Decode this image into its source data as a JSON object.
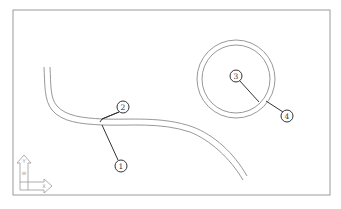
{
  "diagram": {
    "type": "cad-viewport",
    "frame": {
      "x": 13,
      "y": 10,
      "width": 317,
      "height": 185,
      "stroke": "#9a9a9a"
    },
    "colors": {
      "geometry": "#8c8c8c",
      "leader": "#333333",
      "callout_stroke": "#333333",
      "background": "#ffffff"
    },
    "callouts": [
      {
        "id": "1",
        "label": "1",
        "cx": 121,
        "cy": 166,
        "target": "curve-lower-edge"
      },
      {
        "id": "2",
        "label": "2",
        "cx": 123,
        "cy": 107,
        "target": "curve-upper-edge"
      },
      {
        "id": "3",
        "label": "3",
        "cx": 236,
        "cy": 76,
        "target": "circle-inner-edge"
      },
      {
        "id": "4",
        "label": "4",
        "cx": 287,
        "cy": 116,
        "target": "circle-outer-edge"
      }
    ],
    "ucs_icon": {
      "x_label": "X",
      "y_label": "Y",
      "w_label": "W"
    },
    "ring": {
      "cx": 236,
      "cy": 79,
      "r_outer": 39,
      "r_inner": 34
    }
  }
}
